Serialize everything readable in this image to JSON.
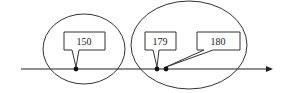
{
  "diagram": {
    "type": "number-line-callouts",
    "axis": {
      "y": 69,
      "x_start": 21,
      "x_end": 272,
      "direction": "right",
      "color": "#222222"
    },
    "groups": [
      {
        "id": "group-left",
        "ellipse": {
          "cx": 84,
          "cy": 49,
          "rx": 41,
          "ry": 35
        }
      },
      {
        "id": "group-right",
        "ellipse": {
          "cx": 189,
          "cy": 45,
          "rx": 58,
          "ry": 44
        }
      }
    ],
    "points": [
      {
        "label": "150",
        "x": 76,
        "box": {
          "x": 64,
          "y": 32,
          "w": 41,
          "h": 18
        }
      },
      {
        "label": "179",
        "x": 157,
        "box": {
          "x": 145,
          "y": 32,
          "w": 31,
          "h": 18
        }
      },
      {
        "label": "180",
        "x": 166,
        "box": {
          "x": 197,
          "y": 32,
          "w": 43,
          "h": 18
        }
      }
    ]
  }
}
